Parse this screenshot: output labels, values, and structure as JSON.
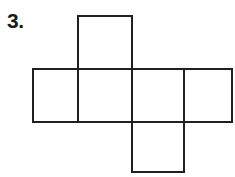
{
  "figure": {
    "problem_label": "3.",
    "caption": "",
    "type": "cube-net",
    "colors": {
      "stroke": "#231f20",
      "fill": "#ffffff",
      "background": "#ffffff",
      "label": "#1a1a1a"
    },
    "stroke_width": 2.1,
    "faces": [
      {
        "name": "top-face",
        "x": 78,
        "y": 16,
        "width": 54,
        "height": 53
      },
      {
        "name": "middle-left-face",
        "x": 33,
        "y": 69,
        "width": 45,
        "height": 53
      },
      {
        "name": "middle-center-left-face",
        "x": 78,
        "y": 69,
        "width": 54,
        "height": 53
      },
      {
        "name": "middle-center-right-face",
        "x": 132,
        "y": 69,
        "width": 52,
        "height": 53
      },
      {
        "name": "middle-right-face",
        "x": 184,
        "y": 69,
        "width": 48,
        "height": 53
      },
      {
        "name": "bottom-face",
        "x": 132,
        "y": 122,
        "width": 52,
        "height": 50
      }
    ]
  }
}
